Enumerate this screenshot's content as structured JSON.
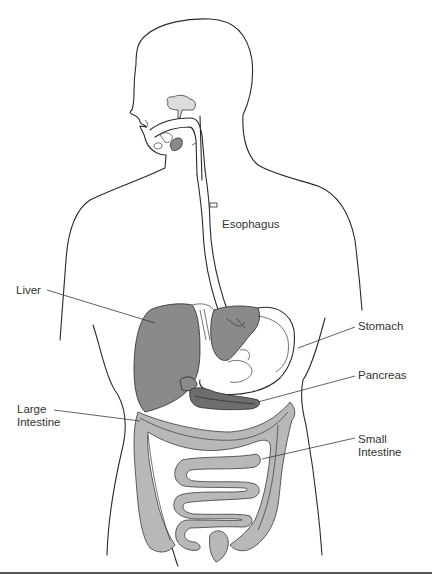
{
  "diagram": {
    "labels": {
      "esophagus": "Esophagus",
      "liver": "Liver",
      "stomach": "Stomach",
      "pancreas": "Pancreas",
      "large_intestine": "Large\nIntestine",
      "small_intestine": "Small\nIntestine"
    },
    "colors": {
      "outline": "#2a2a2a",
      "liver_fill": "#8a8a8a",
      "intestine_fill": "#b8b8b8",
      "pancreas_fill": "#6e6e6e",
      "label_text": "#333333",
      "background": "#ffffff"
    }
  }
}
